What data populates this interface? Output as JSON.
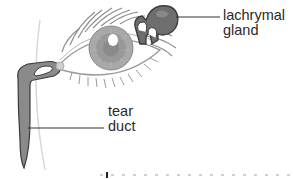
{
  "diagram": {
    "labels": {
      "lachrymal_gland": {
        "line1": "lachrymal",
        "line2": "gland"
      },
      "tear_duct": {
        "line1": "tear",
        "line2": "duct"
      }
    },
    "colors": {
      "gland_fill": "#6e6e6e",
      "duct_fill": "#8a8a8a",
      "outline": "#3a3a3a",
      "iris": "#9a9a9a",
      "text": "#2a2a2a",
      "face_arc": "#d8d8d8"
    },
    "caption": ""
  }
}
